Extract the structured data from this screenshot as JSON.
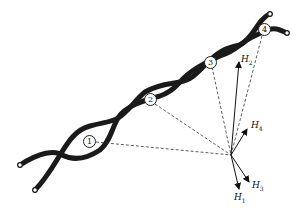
{
  "diagram": {
    "type": "twisted-pair-field-diagram",
    "segments": [
      {
        "id": "seg-1",
        "label": "1"
      },
      {
        "id": "seg-2",
        "label": "2"
      },
      {
        "id": "seg-3",
        "label": "3"
      },
      {
        "id": "seg-4",
        "label": "4"
      }
    ],
    "vectors": [
      {
        "id": "H1",
        "symbol": "H",
        "sub": "1"
      },
      {
        "id": "H2",
        "symbol": "H",
        "sub": "2"
      },
      {
        "id": "H3",
        "symbol": "H",
        "sub": "3"
      },
      {
        "id": "H4",
        "symbol": "H",
        "sub": "4"
      }
    ],
    "colors": {
      "wire": "#1a1a1a",
      "dash": "#333333",
      "background": "#ffffff"
    }
  }
}
